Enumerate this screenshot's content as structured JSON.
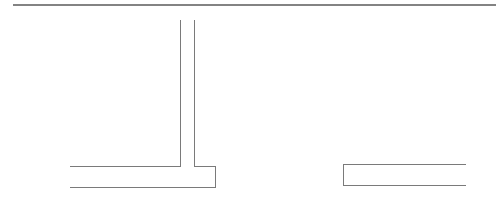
{
  "diagram": {
    "type": "line-drawing",
    "width": 497,
    "height": 198,
    "colors": {
      "background": "#ffffff",
      "header_rule": "#5a5a5a",
      "stroke": "#7a7a7a"
    },
    "header_rule": {
      "x1": 13,
      "y1": 5,
      "x2": 496,
      "y2": 5,
      "stroke_width": 1.6
    },
    "left_shape": {
      "description": "T-shaped outline: vertical stem rising from a horizontal base",
      "stroke_width": 1,
      "points": [
        [
          70,
          166
        ],
        [
          180,
          166
        ],
        [
          180,
          20
        ],
        [
          180,
          20
        ]
      ],
      "paths": {
        "left_part": "M70 166 L180 166 L180 20",
        "right_part": "M194 20 L194 166 L215 166 L215 187 L70 187"
      }
    },
    "right_shape": {
      "description": "Open rectangle bracket (open on right)",
      "stroke_width": 1,
      "path": "M466 164 L343 164 L343 185 L466 185"
    }
  }
}
